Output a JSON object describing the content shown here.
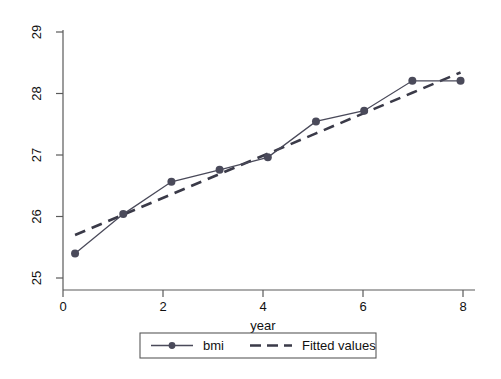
{
  "chart_data": {
    "type": "line",
    "title": "",
    "xlabel": "year",
    "ylabel": "",
    "x": [
      0,
      1,
      2,
      3,
      4,
      5,
      6,
      7,
      8
    ],
    "series": [
      {
        "name": "bmi",
        "style": "solid-with-markers",
        "color": "#4a4a5a",
        "values": [
          25.41,
          26.07,
          26.61,
          26.81,
          27.02,
          27.62,
          27.8,
          28.3,
          28.3
        ]
      },
      {
        "name": "Fitted values",
        "style": "dashed",
        "color": "#3a3a48",
        "values": [
          25.72,
          26.06,
          26.4,
          26.74,
          27.08,
          27.42,
          27.76,
          28.1,
          28.44
        ]
      }
    ],
    "xticks": [
      0,
      2,
      4,
      6,
      8
    ],
    "xtick_labels": [
      "0",
      "2",
      "4",
      "6",
      "8"
    ],
    "yticks": [
      25,
      26,
      27,
      28,
      29
    ],
    "ytick_labels": [
      "25",
      "26",
      "27",
      "28",
      "29"
    ],
    "xlim": [
      -0.25,
      8.3
    ],
    "ylim": [
      24.8,
      29.15
    ],
    "grid": false,
    "legend_position": "bottom-center",
    "legend_entries": [
      "bmi",
      "Fitted values"
    ]
  },
  "axes": {
    "x_axis_title": "year",
    "y_axis_title": ""
  },
  "legend": {
    "entry_one_label": "bmi",
    "entry_two_label": "Fitted values"
  }
}
